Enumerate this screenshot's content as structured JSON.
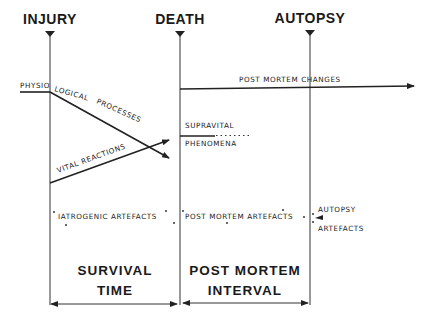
{
  "milestones": {
    "injury": "INJURY",
    "death": "DEATH",
    "autopsy": "AUTOPSY"
  },
  "processes": {
    "physiological_1": "PHYSIO",
    "physiological_2": "LOGICAL",
    "physiological_3": "PROCESSES",
    "vital_reactions": "VITAL  REACTIONS",
    "post_mortem_changes": "POST  MORTEM  CHANGES",
    "supravital_1": "SUPRAVITAL",
    "supravital_2": "PHENOMENA"
  },
  "artefacts": {
    "iatrogenic": "IATROGENIC  ARTEFACTS",
    "post_mortem": "POST  MORTEM  ARTEFACTS",
    "autopsy_1": "AUTOPSY",
    "autopsy_2": "ARTEFACTS"
  },
  "intervals": {
    "survival_1": "SURVIVAL",
    "survival_2": "TIME",
    "pmi_1": "POST  MORTEM",
    "pmi_2": "INTERVAL"
  },
  "colors": {
    "ink": "#222222",
    "background": "#ffffff"
  }
}
